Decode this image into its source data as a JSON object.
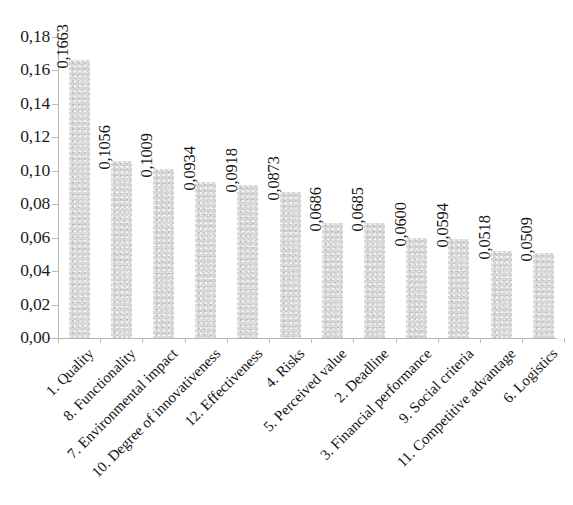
{
  "chart_data": {
    "type": "bar",
    "title": "",
    "subtitle": "",
    "xlabel": "",
    "ylabel": "",
    "ylim": [
      0,
      0.18
    ],
    "ytick_labels": [
      "0,00",
      "0,02",
      "0,04",
      "0,06",
      "0,08",
      "0,10",
      "0,12",
      "0,14",
      "0,16",
      "0,18"
    ],
    "ytick_values": [
      0.0,
      0.02,
      0.04,
      0.06,
      0.08,
      0.1,
      0.12,
      0.14,
      0.16,
      0.18
    ],
    "grid": false,
    "legend": false,
    "legend_position": "none",
    "decimal_separator": ",",
    "bar_color": "#d8d8d8",
    "axis_color": "#b5b5b5",
    "text_color": "#141414",
    "background": "#ffffff",
    "categories": [
      "1. Quality",
      "8. Functionality",
      "7. Environmental impact",
      "10. Degree of innovativeness",
      "12. Effectiveness",
      "4. Risks",
      "5. Perceived value",
      "2. Deadline",
      "3. Financial performance",
      "9. Social criteria",
      "11. Competitive advantage",
      "6. Logistics"
    ],
    "values": [
      0.1663,
      0.1056,
      0.1009,
      0.0934,
      0.0918,
      0.0873,
      0.0686,
      0.0685,
      0.06,
      0.0594,
      0.0518,
      0.0509
    ],
    "value_labels": [
      "0,1663",
      "0,1056",
      "0,1009",
      "0,0934",
      "0,0918",
      "0,0873",
      "0,0686",
      "0,0685",
      "0,0600",
      "0,0594",
      "0,0518",
      "0,0509"
    ]
  }
}
